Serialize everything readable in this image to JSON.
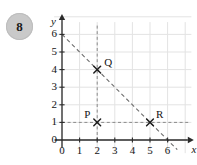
{
  "question": {
    "number": "8",
    "badge_color": "#c9c9c9"
  },
  "chart_data": {
    "type": "scatter",
    "title": "",
    "xlabel": "x",
    "ylabel": "y",
    "xlim": [
      0,
      6
    ],
    "ylim": [
      0,
      6
    ],
    "xticks": [
      "0",
      "1",
      "2",
      "3",
      "4",
      "5",
      "6"
    ],
    "yticks": [
      "0",
      "1",
      "2",
      "3",
      "4",
      "5",
      "6"
    ],
    "grid": true,
    "legend": "none",
    "grid_color": "#e3e3e3",
    "axis_color": "#2b2b2b",
    "series_color": "#555555",
    "points": [
      {
        "name": "Q",
        "x": 2,
        "y": 4,
        "marker": "x",
        "label_dx": 7,
        "label_dy": -14
      },
      {
        "name": "P",
        "x": 2,
        "y": 1,
        "marker": "x",
        "label_dx": -13,
        "label_dy": -14
      },
      {
        "name": "R",
        "x": 5,
        "y": 1,
        "marker": "x",
        "label_dx": 6,
        "label_dy": -14
      }
    ],
    "lines": [
      {
        "name": "constraint-line",
        "style": "dashed",
        "from": [
          0,
          6
        ],
        "to": [
          6.55,
          -0.55
        ],
        "equation": "x + y = 6"
      },
      {
        "name": "vertical-guide-x2",
        "style": "dashed",
        "from": [
          2,
          6.5
        ],
        "to": [
          2,
          0
        ],
        "equation": "x = 2"
      },
      {
        "name": "horizontal-guide-y1",
        "style": "dashed",
        "from": [
          0,
          1
        ],
        "to": [
          7.2,
          1
        ],
        "equation": "y = 1"
      }
    ]
  }
}
